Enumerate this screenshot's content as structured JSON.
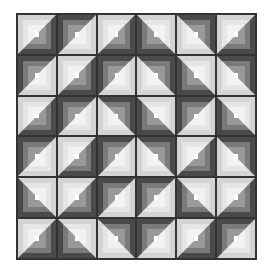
{
  "colors": {
    "dark1": "#4a4a4a",
    "dark2": "#7a7a7a",
    "dark3": "#999999",
    "light1": "#d4d4d4",
    "light2": "#e6e6e6",
    "light3": "#f2f2f2",
    "center": "#ffffff",
    "line": "#333333"
  },
  "grid": {
    "rows": 6,
    "cols": 6,
    "orientations": [
      [
        "RB",
        "LT",
        "RB",
        "LB",
        "RT",
        "RB"
      ],
      [
        "LT",
        "RB",
        "LT",
        "RT",
        "LB",
        "RT"
      ],
      [
        "RB",
        "LT",
        "RT",
        "LB",
        "LT",
        "LB"
      ],
      [
        "LT",
        "RB",
        "LT",
        "RT",
        "RB",
        "RT"
      ],
      [
        "LB",
        "RB",
        "LT",
        "LT",
        "LB",
        "RB"
      ],
      [
        "RB",
        "LB",
        "RT",
        "LT",
        "RB",
        "LT"
      ]
    ]
  }
}
